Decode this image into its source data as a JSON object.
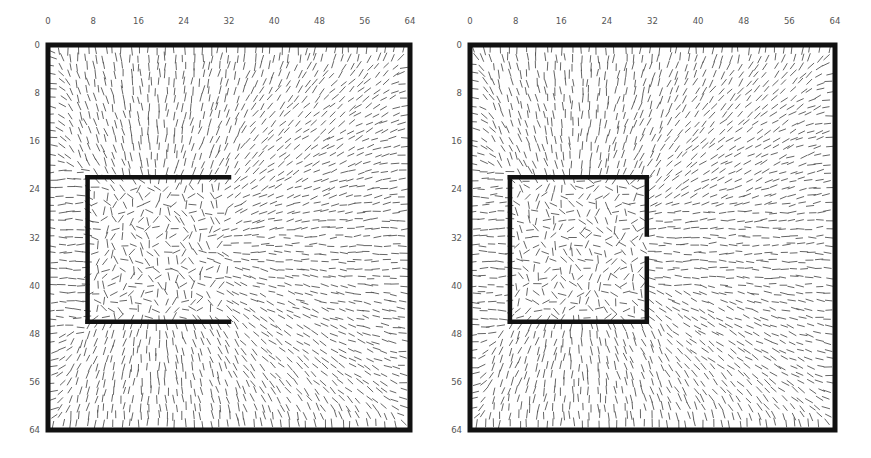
{
  "figure": {
    "colors": {
      "frame": "#111111",
      "director": "#555555",
      "tick_label": "#555555",
      "background": "#ffffff"
    }
  },
  "axes": {
    "x_ticks": [
      "0",
      "8",
      "16",
      "24",
      "32",
      "40",
      "48",
      "56",
      "64"
    ],
    "y_ticks": [
      "0",
      "8",
      "16",
      "24",
      "32",
      "40",
      "48",
      "56",
      "64"
    ],
    "x_range": [
      0,
      64
    ],
    "y_range": [
      0,
      64
    ]
  },
  "panels": [
    {
      "name": "left",
      "outer_box": {
        "x": [
          0,
          64
        ],
        "y": [
          0,
          64
        ]
      },
      "inner_walls": [
        {
          "type": "top",
          "x": [
            7,
            32
          ],
          "y": 22
        },
        {
          "type": "left",
          "x": 7,
          "y": [
            22,
            46
          ]
        },
        {
          "type": "bottom",
          "x": [
            7,
            32
          ],
          "y": 46
        }
      ],
      "opening": "right side fully open"
    },
    {
      "name": "right",
      "outer_box": {
        "x": [
          0,
          64
        ],
        "y": [
          0,
          64
        ]
      },
      "inner_walls": [
        {
          "type": "top",
          "x": [
            7,
            31
          ],
          "y": 22
        },
        {
          "type": "left",
          "x": 7,
          "y": [
            22,
            46
          ]
        },
        {
          "type": "bottom",
          "x": [
            7,
            31
          ],
          "y": 46
        },
        {
          "type": "right-upper",
          "x": 31,
          "y": [
            22,
            31.5
          ]
        },
        {
          "type": "right-lower",
          "x": 31,
          "y": [
            35.5,
            46
          ]
        }
      ],
      "opening": "small gap in right wall at y 31.5-35.5"
    }
  ],
  "chart_data": [
    {
      "type": "vector-field",
      "title": "",
      "xlabel": "",
      "ylabel": "",
      "x_ticks": [
        0,
        8,
        16,
        24,
        32,
        40,
        48,
        56,
        64
      ],
      "y_ticks": [
        0,
        8,
        16,
        24,
        32,
        40,
        48,
        56,
        64
      ],
      "xlim": [
        0,
        64
      ],
      "ylim": [
        0,
        64
      ],
      "grid": false,
      "field": "headless director lines, vertical near top/bottom walls, horizontal near left wall, radiating from box center, disordered inside box",
      "box_center": [
        19,
        34
      ],
      "inner_box": {
        "x": [
          7,
          32
        ],
        "y": [
          22,
          46
        ],
        "open_side": "right"
      }
    },
    {
      "type": "vector-field",
      "title": "",
      "xlabel": "",
      "ylabel": "",
      "x_ticks": [
        0,
        8,
        16,
        24,
        32,
        40,
        48,
        56,
        64
      ],
      "y_ticks": [
        0,
        8,
        16,
        24,
        32,
        40,
        48,
        56,
        64
      ],
      "xlim": [
        0,
        64
      ],
      "ylim": [
        0,
        64
      ],
      "grid": false,
      "field": "headless director lines; mostly horizontal to the right of the box through the gap; disordered inside box",
      "box_center": [
        19,
        34
      ],
      "inner_box": {
        "x": [
          7,
          31
        ],
        "y": [
          22,
          46
        ],
        "open_side": "right-gap",
        "gap_y": [
          31.5,
          35.5
        ]
      }
    }
  ]
}
